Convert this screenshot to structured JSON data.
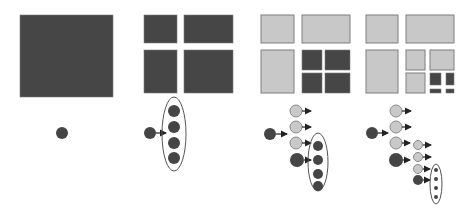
{
  "diagram": {
    "colors": {
      "active": "#454545",
      "inactive": "#c9c9c9",
      "outline": "#8a8a8a"
    },
    "stages": [
      {
        "label": "",
        "level": 0
      },
      {
        "label": "",
        "level": 1
      },
      {
        "label": "",
        "level": 2
      },
      {
        "label": "",
        "level": 3
      }
    ]
  }
}
